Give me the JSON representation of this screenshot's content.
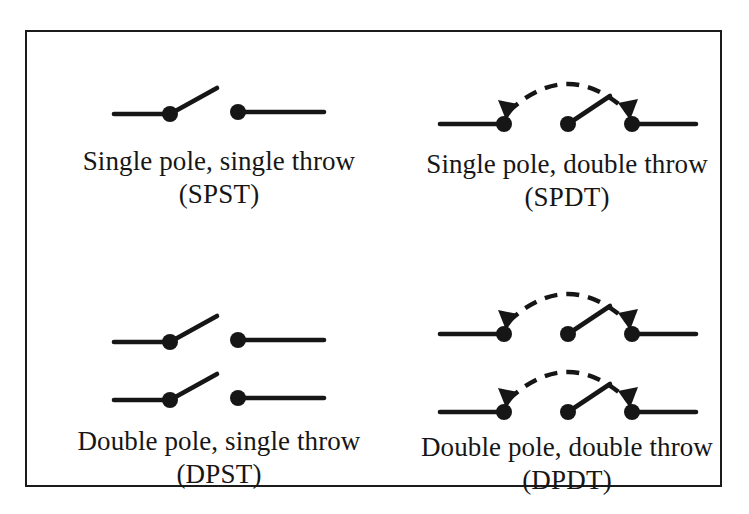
{
  "figure": {
    "background_color": "#ffffff",
    "ink_color": "#161616",
    "frame": {
      "name": "figure-border",
      "border_color": "#1b1b1b",
      "border_width_px": 2
    },
    "panels": [
      {
        "id": "spst",
        "symbol_kind": "single-pole-single-throw-switch",
        "poles": 1,
        "throws": 1,
        "has_transfer_arc": false,
        "rows": 1,
        "caption_main": "Single pole, single throw",
        "caption_abbr": "(SPST)"
      },
      {
        "id": "spdt",
        "symbol_kind": "single-pole-double-throw-switch",
        "poles": 1,
        "throws": 2,
        "has_transfer_arc": true,
        "rows": 1,
        "caption_main": "Single pole, double throw",
        "caption_abbr": "(SPDT)"
      },
      {
        "id": "dpst",
        "symbol_kind": "double-pole-single-throw-switch",
        "poles": 2,
        "throws": 1,
        "has_transfer_arc": false,
        "rows": 2,
        "caption_main": "Double pole, single throw",
        "caption_abbr": "(DPST)"
      },
      {
        "id": "dpdt",
        "symbol_kind": "double-pole-double-throw-switch",
        "poles": 2,
        "throws": 2,
        "has_transfer_arc": true,
        "rows": 2,
        "caption_main": "Double pole, double throw",
        "caption_abbr": "(DPDT)"
      }
    ]
  }
}
